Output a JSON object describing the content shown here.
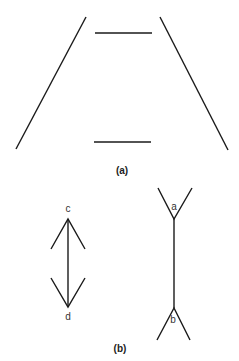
{
  "figure_a": {
    "caption": "(a)",
    "description": "Ponzo illusion: two equal horizontal lines between converging oblique lines",
    "lines": {
      "left_oblique": {
        "x1": 86,
        "y1": 17,
        "x2": 16,
        "y2": 149
      },
      "right_oblique": {
        "x1": 160,
        "y1": 17,
        "x2": 228,
        "y2": 150
      },
      "top_horizontal": {
        "x1": 95,
        "y1": 33,
        "x2": 152,
        "y2": 33
      },
      "bottom_horizontal": {
        "x1": 94,
        "y1": 142,
        "x2": 151,
        "y2": 142
      }
    }
  },
  "figure_b": {
    "caption": "(b)",
    "description": "Müller-Lyer illusion: arrowheads vs. fins",
    "left_figure": {
      "top_label": "c",
      "bottom_label": "d"
    },
    "right_figure": {
      "top_label": "a",
      "bottom_label": "b"
    }
  }
}
